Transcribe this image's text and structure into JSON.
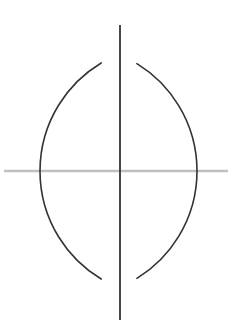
{
  "figure": {
    "canvas": {
      "width": 232,
      "height": 333,
      "background": "#ffffff"
    },
    "colors": {
      "arc_stroke": "#333333",
      "vertical_line_stroke": "#333333",
      "horizontal_line_stroke": "#bfbfbf",
      "background": "#ffffff"
    },
    "strokes": {
      "arc_width": 1.6,
      "vertical_line_width": 1.8,
      "horizontal_line_width": 2.6
    },
    "horizontal_line": {
      "label": "base line",
      "x1": 4,
      "y1": 171,
      "x2": 228,
      "y2": 171
    },
    "vertical_line": {
      "label": "perpendicular bisector",
      "x1": 120,
      "y1": 25,
      "x2": 120,
      "y2": 320
    },
    "arc_left": {
      "label": "arc centered at left point",
      "center_x": 71,
      "center_y": 171,
      "radius": 126,
      "path": "M 80.5 28.5 C 120 70 132 112 132 171 C 132 230 120 272 80.5 313.5"
    },
    "arc_right": {
      "label": "arc centered at right point",
      "center_x": 166,
      "center_y": 171,
      "radius": 126,
      "path": "M 158.5 28.5 C 119 70 107 112 107 171 C 107 230 119 272 158.5 313.5"
    },
    "intersections": [
      {
        "label": "upper intersection point",
        "x": 120,
        "y": 57
      },
      {
        "label": "lower intersection point",
        "x": 120,
        "y": 283
      }
    ],
    "arc_crossings_on_baseline": [
      {
        "label": "left arc crossing",
        "x": 71,
        "y": 171
      },
      {
        "label": "right arc crossing",
        "x": 166,
        "y": 171
      }
    ]
  }
}
